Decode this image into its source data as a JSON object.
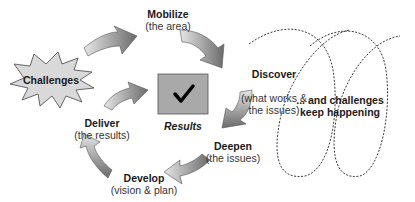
{
  "stages": [
    {
      "title": "Mobilize",
      "subtitle": "(the area)"
    },
    {
      "title": "Discover",
      "subtitle": "(what works &\nthe issues)"
    },
    {
      "title": "Deepen",
      "subtitle": "(the issues)"
    },
    {
      "title": "Develop",
      "subtitle": "(vision & plan)"
    },
    {
      "title": "Deliver",
      "subtitle": "(the results)"
    }
  ],
  "center": {
    "label": "Results",
    "icon": "checkmark-icon"
  },
  "burst": {
    "label": "Challenges"
  },
  "loop_text": "... and challenges\nkeep happening",
  "colors": {
    "arrow_dark": "#6e6e6e",
    "arrow_light": "#e0e0e0",
    "box_fill": "#a9a9a9",
    "burst_fill": "#d9d9d9"
  }
}
